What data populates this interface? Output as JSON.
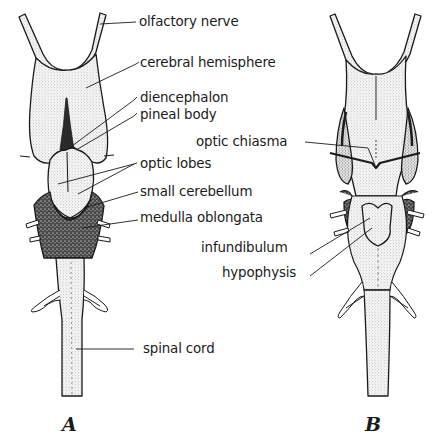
{
  "figure": {
    "panels": [
      {
        "id": "A",
        "letter": "A",
        "view": "dorsal"
      },
      {
        "id": "B",
        "letter": "B",
        "view": "ventral"
      }
    ]
  },
  "labels": {
    "olfactory_nerve": "olfactory nerve",
    "cerebral_hemisphere": "cerebral hemisphere",
    "diencephalon": "diencephalon",
    "pineal_body": "pineal body",
    "optic_chiasma": "optic chiasma",
    "optic_lobes": "optic lobes",
    "small_cerebellum": "small cerebellum",
    "medulla_oblongata": "medulla oblongata",
    "infundibulum": "infundibulum",
    "hypophysis": "hypophysis",
    "spinal_cord": "spinal cord"
  },
  "colors": {
    "ink": "#1a1a1a",
    "stipple_light": "#dcdcdc",
    "stipple_dark": "#5a5a5a",
    "background": "#ffffff"
  }
}
